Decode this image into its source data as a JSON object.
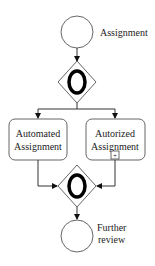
{
  "diagram": {
    "type": "BPMN process",
    "colors": {
      "stroke": "#555555",
      "gateway_mark": "#000000",
      "text": "#222222",
      "background": "#ffffff"
    },
    "start_event": {
      "label": "Assignment"
    },
    "split_gateway": {
      "kind": "inclusive",
      "marker": "O"
    },
    "tasks": [
      {
        "label_line1": "Automated",
        "label_line2": "Assignment",
        "subprocess_marker": false
      },
      {
        "label_line1": "Autorized",
        "label_line2": "Assignment",
        "subprocess_marker": true,
        "marker_glyph": "+"
      }
    ],
    "join_gateway": {
      "kind": "inclusive",
      "marker": "O"
    },
    "end_event": {
      "label_line1": "Further",
      "label_line2": "review"
    }
  }
}
